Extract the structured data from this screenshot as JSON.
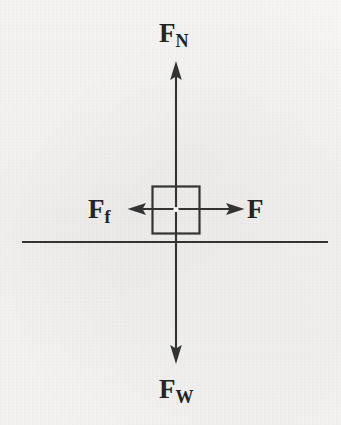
{
  "diagram": {
    "type": "free-body-diagram",
    "background_color": "#f6f5f3",
    "stroke_color": "#343434",
    "text_color": "#242424",
    "body": {
      "shape": "square",
      "name": "block",
      "center_x": 176,
      "center_y": 210,
      "size": 48,
      "fill": "none",
      "center_dot": true
    },
    "ground_line": {
      "name": "ground-surface",
      "x1": 22,
      "y1": 242,
      "x2": 328,
      "y2": 242
    },
    "forces": [
      {
        "id": "normal",
        "symbol": "F",
        "subscript": "N",
        "label": "F_N",
        "direction": "up",
        "tail_x": 176,
        "tail_y": 210,
        "tip_x": 176,
        "tip_y": 62,
        "label_x": 159,
        "label_y": 20
      },
      {
        "id": "weight",
        "symbol": "F",
        "subscript": "W",
        "label": "F_W",
        "direction": "down",
        "tail_x": 176,
        "tail_y": 210,
        "tip_x": 176,
        "tip_y": 363,
        "label_x": 159,
        "label_y": 376
      },
      {
        "id": "friction",
        "symbol": "F",
        "subscript": "f",
        "label": "F_f",
        "direction": "left",
        "tail_x": 176,
        "tail_y": 209,
        "tip_x": 128,
        "tip_y": 209,
        "label_x": 88,
        "label_y": 196
      },
      {
        "id": "applied",
        "symbol": "F",
        "subscript": "",
        "label": "F",
        "direction": "right",
        "tail_x": 176,
        "tail_y": 209,
        "tip_x": 244,
        "tip_y": 209,
        "label_x": 247,
        "label_y": 196
      }
    ]
  }
}
